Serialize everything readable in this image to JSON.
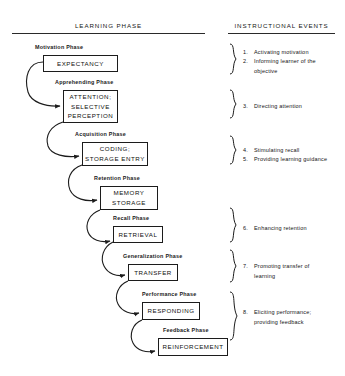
{
  "headers": {
    "left": "LEARNING PHASE",
    "right": "INSTRUCTIONAL EVENTS"
  },
  "stages": [
    {
      "phase_label": "Motivation Phase",
      "box_label": "EXPECTANCY",
      "phase_x": 35,
      "phase_y": 44,
      "box_x": 43,
      "box_y": 55,
      "box_w": 75,
      "box_h": 17
    },
    {
      "phase_label": "Apprehending  Phase",
      "box_label": "ATTENTION;\nSELECTIVE\nPERCEPTION",
      "phase_x": 55,
      "phase_y": 79,
      "box_x": 63,
      "box_y": 90,
      "box_w": 55,
      "box_h": 33
    },
    {
      "phase_label": "Acquisition Phase",
      "box_label": "CODING;\nSTORAGE ENTRY",
      "phase_x": 75,
      "phase_y": 131,
      "box_x": 82,
      "box_y": 142,
      "box_w": 66,
      "box_h": 24
    },
    {
      "phase_label": "Retention Phase",
      "box_label": "MEMORY\nSTORAGE",
      "phase_x": 94,
      "phase_y": 175,
      "box_x": 100,
      "box_y": 186,
      "box_w": 58,
      "box_h": 24
    },
    {
      "phase_label": "Recall Phase",
      "box_label": "RETRIEVAL",
      "phase_x": 113,
      "phase_y": 215,
      "box_x": 113,
      "box_y": 226,
      "box_w": 50,
      "box_h": 17
    },
    {
      "phase_label": "Generalization Phase",
      "box_label": "TRANSFER",
      "phase_x": 123,
      "phase_y": 253,
      "box_x": 128,
      "box_y": 264,
      "box_w": 50,
      "box_h": 17
    },
    {
      "phase_label": "Performance Phase",
      "box_label": "RESPONDING",
      "phase_x": 142,
      "phase_y": 291,
      "box_x": 142,
      "box_y": 302,
      "box_w": 58,
      "box_h": 18
    },
    {
      "phase_label": "Feedback Phase",
      "box_label": "REINFORCEMENT",
      "phase_x": 163,
      "phase_y": 327,
      "box_x": 158,
      "box_y": 338,
      "box_w": 70,
      "box_h": 18
    }
  ],
  "events": [
    {
      "number": "1.",
      "text": "Activating motivation",
      "x": 243,
      "y": 48
    },
    {
      "number": "2.",
      "text": "Informing learner of the\nobjective",
      "x": 243,
      "y": 57
    },
    {
      "number": "3.",
      "text": "Directing attention",
      "x": 243,
      "y": 102
    },
    {
      "number": "4.",
      "text": "Stimulating recall",
      "x": 243,
      "y": 146
    },
    {
      "number": "5.",
      "text": "Providing learning guidance",
      "x": 243,
      "y": 155
    },
    {
      "number": "6.",
      "text": "Enhancing retention",
      "x": 243,
      "y": 224
    },
    {
      "number": "7.",
      "text": "Promoting transfer of\nlearning",
      "x": 243,
      "y": 262
    },
    {
      "number": "8.",
      "text": "Eliciting performance;\nproviding feedback",
      "x": 243,
      "y": 308
    }
  ],
  "colors": {
    "ink": "#1a1a1a",
    "line": "#2a2a2a",
    "background": "#ffffff"
  }
}
